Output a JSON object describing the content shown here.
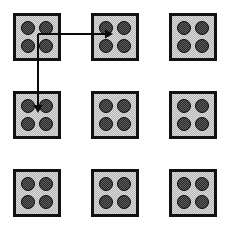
{
  "diagram": {
    "background_color": "#fefefe",
    "canvas": {
      "width": 228,
      "height": 228
    },
    "tile": {
      "size": 48,
      "border_width": 3,
      "border_color": "#111111",
      "fill_color": "#c9c9c9",
      "fill_pattern": "stippled-gray",
      "dot": {
        "diameter": 14,
        "fill_color": "#4a4a4a",
        "outline_color": "#0a0a0a",
        "fill_pattern": "stippled-dark",
        "count_per_tile": 4,
        "positions": [
          "top-left",
          "top-right",
          "bottom-left",
          "bottom-right"
        ]
      }
    },
    "grid": {
      "rows": 3,
      "columns": 3,
      "column_x": [
        13,
        91,
        169
      ],
      "row_y": [
        13,
        91,
        169
      ],
      "cells": [
        {
          "name": "tile-r1c1",
          "row": 1,
          "column": 1,
          "x": 13,
          "y": 13,
          "dots": 4
        },
        {
          "name": "tile-r1c2",
          "row": 1,
          "column": 2,
          "x": 91,
          "y": 13,
          "dots": 4
        },
        {
          "name": "tile-r1c3",
          "row": 1,
          "column": 3,
          "x": 169,
          "y": 13,
          "dots": 4
        },
        {
          "name": "tile-r2c1",
          "row": 2,
          "column": 1,
          "x": 13,
          "y": 91,
          "dots": 4
        },
        {
          "name": "tile-r2c2",
          "row": 2,
          "column": 2,
          "x": 91,
          "y": 91,
          "dots": 4
        },
        {
          "name": "tile-r2c3",
          "row": 2,
          "column": 3,
          "x": 169,
          "y": 91,
          "dots": 4
        },
        {
          "name": "tile-r3c1",
          "row": 3,
          "column": 1,
          "x": 13,
          "y": 169,
          "dots": 4
        },
        {
          "name": "tile-r3c2",
          "row": 3,
          "column": 2,
          "x": 91,
          "y": 169,
          "dots": 4
        },
        {
          "name": "tile-r3c3",
          "row": 3,
          "column": 3,
          "x": 169,
          "y": 169,
          "dots": 4
        }
      ]
    },
    "arrows": {
      "stroke_color": "#0a0a0a",
      "stroke_width": 1.2,
      "origin": {
        "x": 38,
        "y": 34,
        "inside_tile": "tile-r1c1"
      },
      "items": [
        {
          "name": "arrow-right",
          "direction": "right",
          "from_tile": "tile-r1c1",
          "to_tile": "tile-r1c2",
          "path": "M 38 34 L 105 34",
          "tip": {
            "x": 113,
            "y": 34
          },
          "head": "solid-triangle"
        },
        {
          "name": "arrow-down",
          "direction": "down",
          "from_tile": "tile-r1c1",
          "to_tile": "tile-r2c1",
          "path": "M 38 34 L 38 105",
          "tip": {
            "x": 38,
            "y": 113
          },
          "head": "solid-triangle"
        }
      ]
    }
  }
}
